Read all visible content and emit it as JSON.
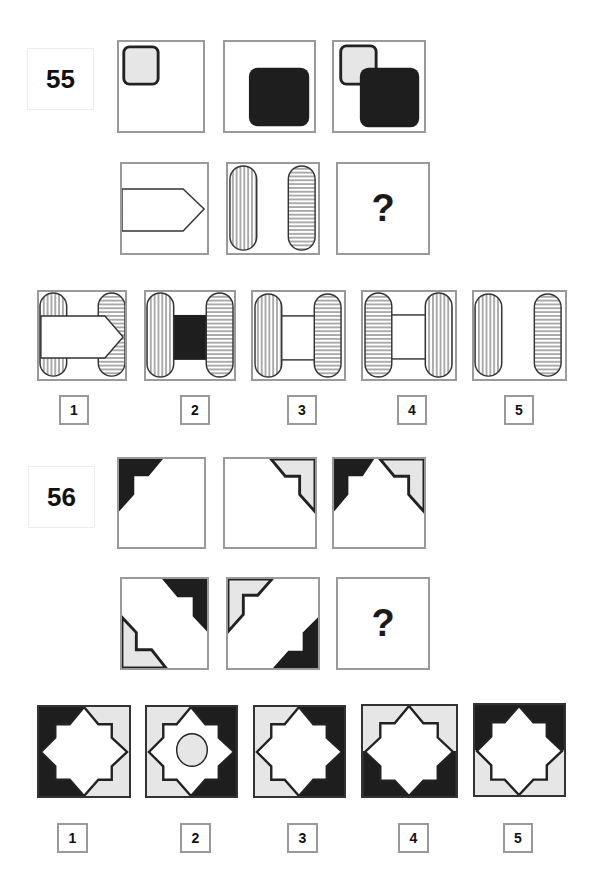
{
  "questions": [
    {
      "number": "55",
      "sequence_row_1": [
        "small-light-rounded-square-top-left",
        "large-dark-rounded-square-bottom-right",
        "small-light-and-large-dark-overlapping"
      ],
      "sequence_row_2": [
        "pentagon-arrow-pointing-right",
        "two-striped-capsules-vertical-and-horizontal",
        "?"
      ],
      "question_mark": "?",
      "options": [
        {
          "label": "1",
          "description": "arrow over two striped capsules"
        },
        {
          "label": "2",
          "description": "two capsules joined by black rectangle"
        },
        {
          "label": "3",
          "description": "vertical-striped left, horizontal-striped right, joined by white rectangle"
        },
        {
          "label": "4",
          "description": "horizontal-striped left, vertical-striped right, joined by white rectangle"
        },
        {
          "label": "5",
          "description": "two capsules, vertical left, horizontal right"
        }
      ]
    },
    {
      "number": "56",
      "sequence_row_1": [
        "dark-corner-top-left",
        "light-corner-top-right",
        "dark-top-left-and-light-top-right"
      ],
      "sequence_row_2": [
        "dark-top-right-and-light-bottom-left",
        "light-top-left-and-dark-bottom-right",
        "?"
      ],
      "question_mark": "?",
      "options": [
        {
          "label": "1",
          "description": "star; dark left corners, light right corners"
        },
        {
          "label": "2",
          "description": "star with circle; light left corners, dark right corners"
        },
        {
          "label": "3",
          "description": "star; light left corners, dark right corners"
        },
        {
          "label": "4",
          "description": "star; light top corners, dark bottom corners"
        },
        {
          "label": "5",
          "description": "star; dark top corners, light bottom corners"
        }
      ]
    }
  ],
  "colors": {
    "dark": "#1e1e1e",
    "light": "#e6e6e6",
    "border": "#9a9a9a",
    "stroke": "#333333"
  }
}
